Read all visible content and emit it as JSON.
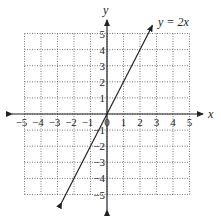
{
  "chart_data": {
    "type": "line",
    "title": "",
    "xlabel": "x",
    "ylabel": "y",
    "xlim": [
      -5,
      5
    ],
    "ylim": [
      -5,
      5
    ],
    "grid": true,
    "x_ticks": [
      "-5",
      "-4",
      "-3",
      "-2",
      "-1",
      "0",
      "1",
      "2",
      "3",
      "4",
      "5"
    ],
    "y_ticks": [
      "-5",
      "-4",
      "-3",
      "-2",
      "-1",
      "1",
      "2",
      "3",
      "4",
      "5"
    ],
    "series": [
      {
        "name": "y = 2x",
        "equation": "y = 2x",
        "x": [
          -2.75,
          2.75
        ],
        "y": [
          -5.5,
          5.5
        ]
      }
    ],
    "annotations": [
      {
        "text": "y = 2x",
        "x": 3.0,
        "y": 5.8
      }
    ]
  },
  "labels": {
    "x_axis": "x",
    "y_axis": "y",
    "line_label": "y = 2x"
  }
}
